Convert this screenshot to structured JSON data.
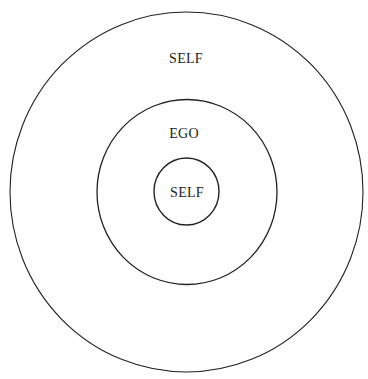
{
  "diagram": {
    "type": "concentric-circles",
    "stroke_color": "#222222",
    "circles": [
      {
        "name": "outer",
        "cx": 186.5,
        "cy": 192,
        "rx": 176.5,
        "ry": 180,
        "label": "SELF",
        "label_x": 186,
        "label_y": 63
      },
      {
        "name": "middle",
        "cx": 187,
        "cy": 192,
        "rx": 90,
        "ry": 92.5,
        "label": "EGO",
        "label_x": 184,
        "label_y": 138
      },
      {
        "name": "inner",
        "cx": 186.5,
        "cy": 191.5,
        "rx": 32.5,
        "ry": 33.5,
        "label": "SELF",
        "label_x": 187,
        "label_y": 197
      }
    ]
  }
}
